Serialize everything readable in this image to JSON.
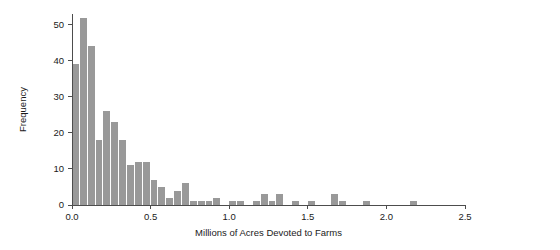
{
  "chart_data": {
    "type": "bar",
    "title": "",
    "subtitle": "",
    "xlabel": "Millions of Acres Devoted to Farms",
    "ylabel": "Frequency",
    "xlim": [
      0.0,
      2.5
    ],
    "ylim": [
      0,
      53
    ],
    "grid": false,
    "legend": "none",
    "bar_color": "#999999",
    "axis_color": "#4d4d4d",
    "bin_width": 0.05,
    "xticks": [
      {
        "value": 0.0,
        "label": "0.0"
      },
      {
        "value": 0.5,
        "label": "0.5"
      },
      {
        "value": 1.0,
        "label": "1.0"
      },
      {
        "value": 1.5,
        "label": "1.5"
      },
      {
        "value": 2.0,
        "label": "2.0"
      },
      {
        "value": 2.5,
        "label": "2.5"
      }
    ],
    "yticks": [
      {
        "value": 0,
        "label": "0"
      },
      {
        "value": 10,
        "label": "10"
      },
      {
        "value": 20,
        "label": "20"
      },
      {
        "value": 30,
        "label": "30"
      },
      {
        "value": 40,
        "label": "40"
      },
      {
        "value": 50,
        "label": "50"
      }
    ],
    "bins": [
      {
        "x0": 0.0,
        "x1": 0.05,
        "value": 39
      },
      {
        "x0": 0.05,
        "x1": 0.1,
        "value": 52
      },
      {
        "x0": 0.1,
        "x1": 0.15,
        "value": 44
      },
      {
        "x0": 0.15,
        "x1": 0.2,
        "value": 18
      },
      {
        "x0": 0.2,
        "x1": 0.25,
        "value": 26
      },
      {
        "x0": 0.25,
        "x1": 0.3,
        "value": 23
      },
      {
        "x0": 0.3,
        "x1": 0.35,
        "value": 18
      },
      {
        "x0": 0.35,
        "x1": 0.4,
        "value": 11
      },
      {
        "x0": 0.4,
        "x1": 0.45,
        "value": 12
      },
      {
        "x0": 0.45,
        "x1": 0.5,
        "value": 12
      },
      {
        "x0": 0.5,
        "x1": 0.55,
        "value": 7
      },
      {
        "x0": 0.55,
        "x1": 0.6,
        "value": 5
      },
      {
        "x0": 0.6,
        "x1": 0.65,
        "value": 2
      },
      {
        "x0": 0.65,
        "x1": 0.7,
        "value": 4
      },
      {
        "x0": 0.7,
        "x1": 0.75,
        "value": 6
      },
      {
        "x0": 0.75,
        "x1": 0.8,
        "value": 1
      },
      {
        "x0": 0.8,
        "x1": 0.85,
        "value": 1
      },
      {
        "x0": 0.85,
        "x1": 0.9,
        "value": 1
      },
      {
        "x0": 0.9,
        "x1": 0.95,
        "value": 2
      },
      {
        "x0": 0.95,
        "x1": 1.0,
        "value": 0
      },
      {
        "x0": 1.0,
        "x1": 1.05,
        "value": 1
      },
      {
        "x0": 1.05,
        "x1": 1.1,
        "value": 1
      },
      {
        "x0": 1.1,
        "x1": 1.15,
        "value": 0
      },
      {
        "x0": 1.15,
        "x1": 1.2,
        "value": 1
      },
      {
        "x0": 1.2,
        "x1": 1.25,
        "value": 3
      },
      {
        "x0": 1.25,
        "x1": 1.3,
        "value": 1
      },
      {
        "x0": 1.3,
        "x1": 1.35,
        "value": 3
      },
      {
        "x0": 1.35,
        "x1": 1.4,
        "value": 0
      },
      {
        "x0": 1.4,
        "x1": 1.45,
        "value": 1
      },
      {
        "x0": 1.45,
        "x1": 1.5,
        "value": 0
      },
      {
        "x0": 1.5,
        "x1": 1.55,
        "value": 1
      },
      {
        "x0": 1.55,
        "x1": 1.6,
        "value": 0
      },
      {
        "x0": 1.6,
        "x1": 1.65,
        "value": 0
      },
      {
        "x0": 1.65,
        "x1": 1.7,
        "value": 3
      },
      {
        "x0": 1.7,
        "x1": 1.75,
        "value": 1
      },
      {
        "x0": 1.75,
        "x1": 1.8,
        "value": 0
      },
      {
        "x0": 1.8,
        "x1": 1.85,
        "value": 0
      },
      {
        "x0": 1.85,
        "x1": 1.9,
        "value": 1
      },
      {
        "x0": 1.9,
        "x1": 1.95,
        "value": 0
      },
      {
        "x0": 1.95,
        "x1": 2.0,
        "value": 0
      },
      {
        "x0": 2.0,
        "x1": 2.05,
        "value": 0
      },
      {
        "x0": 2.05,
        "x1": 2.1,
        "value": 0
      },
      {
        "x0": 2.1,
        "x1": 2.15,
        "value": 0
      },
      {
        "x0": 2.15,
        "x1": 2.2,
        "value": 1
      },
      {
        "x0": 2.2,
        "x1": 2.25,
        "value": 0
      }
    ]
  },
  "plot_geometry": {
    "left": 72,
    "right": 465,
    "top": 14,
    "bottom": 205
  }
}
